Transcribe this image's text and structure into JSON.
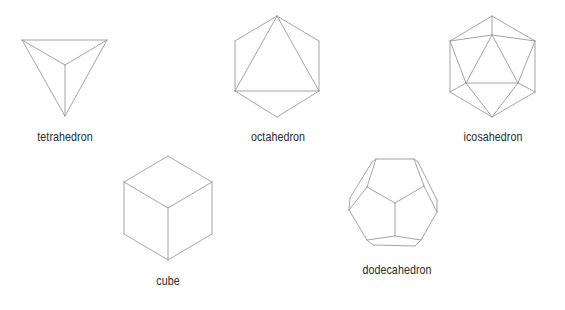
{
  "solids": [
    {
      "id": "tetrahedron",
      "label": "tetrahedron",
      "label_pos": {
        "cx": 65,
        "top": 129
      },
      "vertices": [
        [
          22,
          40
        ],
        [
          107,
          40
        ],
        [
          65,
          65
        ],
        [
          65,
          116
        ]
      ],
      "edges": [
        [
          0,
          1
        ],
        [
          0,
          2
        ],
        [
          1,
          2
        ],
        [
          0,
          3
        ],
        [
          1,
          3
        ],
        [
          2,
          3
        ]
      ]
    },
    {
      "id": "octahedron",
      "label": "octahedron",
      "label_pos": {
        "cx": 278,
        "top": 129
      },
      "vertices": [
        [
          277,
          16
        ],
        [
          235,
          41
        ],
        [
          235,
          91
        ],
        [
          277,
          117
        ],
        [
          319,
          91
        ],
        [
          319,
          41
        ]
      ],
      "edges": [
        [
          0,
          1
        ],
        [
          1,
          2
        ],
        [
          2,
          3
        ],
        [
          3,
          4
        ],
        [
          4,
          5
        ],
        [
          5,
          0
        ],
        [
          0,
          2
        ],
        [
          0,
          4
        ],
        [
          2,
          4
        ]
      ]
    },
    {
      "id": "icosahedron",
      "label": "icosahedron",
      "label_pos": {
        "cx": 493,
        "top": 129
      },
      "vertices": [
        [
          492,
          16
        ],
        [
          450,
          41
        ],
        [
          450,
          92
        ],
        [
          492,
          117
        ],
        [
          535,
          92
        ],
        [
          535,
          41
        ],
        [
          492,
          35
        ],
        [
          466,
          83
        ],
        [
          518,
          83
        ]
      ],
      "edges": [
        [
          0,
          1
        ],
        [
          1,
          2
        ],
        [
          2,
          3
        ],
        [
          3,
          4
        ],
        [
          4,
          5
        ],
        [
          5,
          0
        ],
        [
          0,
          6
        ],
        [
          1,
          6
        ],
        [
          5,
          6
        ],
        [
          1,
          7
        ],
        [
          5,
          8
        ],
        [
          2,
          7
        ],
        [
          4,
          8
        ],
        [
          3,
          7
        ],
        [
          3,
          8
        ],
        [
          6,
          7
        ],
        [
          6,
          8
        ],
        [
          7,
          8
        ]
      ]
    },
    {
      "id": "cube",
      "label": "cube",
      "label_pos": {
        "cx": 168,
        "top": 273
      },
      "vertices": [
        [
          168,
          156
        ],
        [
          124,
          182
        ],
        [
          212,
          182
        ],
        [
          168,
          208
        ],
        [
          124,
          234
        ],
        [
          212,
          234
        ],
        [
          168,
          260
        ]
      ],
      "edges": [
        [
          0,
          1
        ],
        [
          0,
          2
        ],
        [
          1,
          3
        ],
        [
          2,
          3
        ],
        [
          1,
          4
        ],
        [
          2,
          5
        ],
        [
          3,
          6
        ],
        [
          4,
          6
        ],
        [
          5,
          6
        ]
      ]
    },
    {
      "id": "dodecahedron",
      "label": "dodecahedron",
      "label_pos": {
        "cx": 397,
        "top": 262
      },
      "vertices": [
        [
          376,
          159
        ],
        [
          414,
          159
        ],
        [
          372,
          162
        ],
        [
          418,
          162
        ],
        [
          367,
          187
        ],
        [
          424,
          186
        ],
        [
          395,
          203
        ],
        [
          350,
          198
        ],
        [
          437,
          200
        ],
        [
          349,
          210
        ],
        [
          437,
          212
        ],
        [
          395,
          236
        ],
        [
          367,
          240
        ],
        [
          421,
          240
        ],
        [
          373,
          245
        ],
        [
          415,
          246
        ]
      ],
      "edges": [
        [
          0,
          1
        ],
        [
          0,
          2
        ],
        [
          1,
          3
        ],
        [
          0,
          4
        ],
        [
          1,
          5
        ],
        [
          4,
          6
        ],
        [
          5,
          6
        ],
        [
          2,
          7
        ],
        [
          3,
          8
        ],
        [
          7,
          9
        ],
        [
          8,
          10
        ],
        [
          4,
          9
        ],
        [
          5,
          10
        ],
        [
          6,
          11
        ],
        [
          9,
          12
        ],
        [
          10,
          13
        ],
        [
          12,
          14
        ],
        [
          13,
          15
        ],
        [
          11,
          12
        ],
        [
          11,
          13
        ],
        [
          14,
          15
        ]
      ]
    }
  ],
  "style": {
    "edge_color": "#9a9a9a",
    "label_color": "#2a2a2a",
    "background": "#ffffff"
  }
}
